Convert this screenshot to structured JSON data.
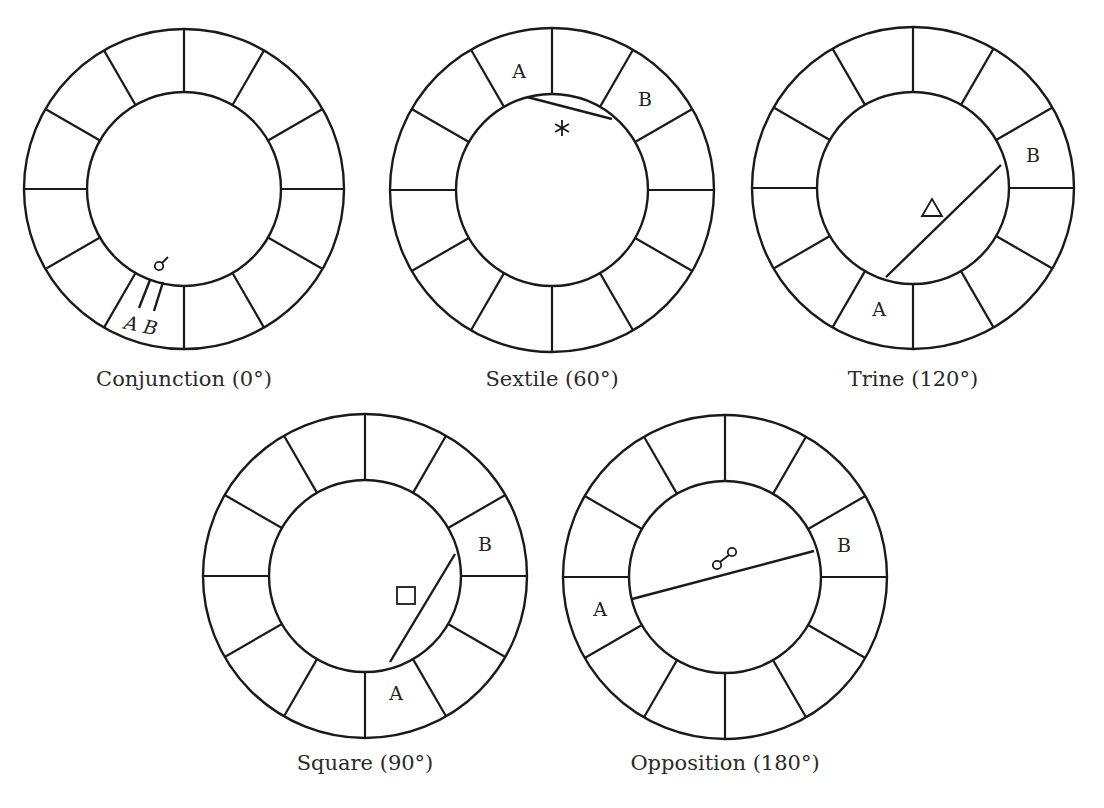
{
  "figure": {
    "background": "#ffffff",
    "line_color": "#1a1a1a",
    "spoke_count": 12,
    "spoke_angle_step_deg": 30
  },
  "wheels": [
    {
      "id": "conjunction",
      "caption": "Conjunction (0°)",
      "aspect_name": "Conjunction",
      "aspect_angle": "0°",
      "cx": 184,
      "cy": 189,
      "r_outer": 160,
      "r_inner": 97,
      "caption_x": 184,
      "caption_y": 386,
      "symbol": "conjunction-glyph",
      "glyph": {
        "type": "conjunction",
        "x": 159,
        "y": 266
      },
      "planets": [
        {
          "label": "A",
          "x": 130,
          "y": 330,
          "italic": true,
          "rotate": 12
        },
        {
          "label": "B",
          "x": 149,
          "y": 334,
          "italic": true,
          "rotate": 12
        }
      ],
      "ticks": [
        {
          "x1": 150,
          "y1": 280,
          "x2": 139,
          "y2": 308
        },
        {
          "x1": 163,
          "y1": 282,
          "x2": 154,
          "y2": 311
        }
      ],
      "chord": null
    },
    {
      "id": "sextile",
      "caption": "Sextile (60°)",
      "aspect_name": "Sextile",
      "aspect_angle": "60°",
      "cx": 552,
      "cy": 190,
      "r_outer": 162,
      "r_inner": 96,
      "caption_x": 552,
      "caption_y": 386,
      "symbol": "sextile-glyph",
      "glyph": {
        "type": "sextile",
        "x": 562,
        "y": 128
      },
      "planets": [
        {
          "label": "A",
          "x": 519,
          "y": 78,
          "italic": false,
          "rotate": 0
        },
        {
          "label": "B",
          "x": 645,
          "y": 106,
          "italic": false,
          "rotate": 0
        }
      ],
      "ticks": [],
      "chord": {
        "x1": 527,
        "y1": 97,
        "x2": 612,
        "y2": 119
      }
    },
    {
      "id": "trine",
      "caption": "Trine (120°)",
      "aspect_name": "Trine",
      "aspect_angle": "120°",
      "cx": 913,
      "cy": 188,
      "r_outer": 161,
      "r_inner": 96,
      "caption_x": 913,
      "caption_y": 386,
      "symbol": "trine-glyph",
      "glyph": {
        "type": "trine",
        "x": 932,
        "y": 208
      },
      "planets": [
        {
          "label": "A",
          "x": 879,
          "y": 316,
          "italic": false,
          "rotate": 0
        },
        {
          "label": "B",
          "x": 1033,
          "y": 162,
          "italic": false,
          "rotate": 0
        }
      ],
      "ticks": [],
      "chord": {
        "x1": 1001,
        "y1": 165,
        "x2": 886,
        "y2": 277
      }
    },
    {
      "id": "square",
      "caption": "Square (90°)",
      "aspect_name": "Square",
      "aspect_angle": "90°",
      "cx": 365,
      "cy": 576,
      "r_outer": 162,
      "r_inner": 96,
      "caption_x": 365,
      "caption_y": 770,
      "symbol": "square-glyph",
      "glyph": {
        "type": "square",
        "x": 406,
        "y": 596
      },
      "planets": [
        {
          "label": "A",
          "x": 396,
          "y": 700,
          "italic": false,
          "rotate": 0
        },
        {
          "label": "B",
          "x": 485,
          "y": 551,
          "italic": false,
          "rotate": 0
        }
      ],
      "ticks": [],
      "chord": {
        "x1": 455,
        "y1": 554,
        "x2": 390,
        "y2": 662
      }
    },
    {
      "id": "opposition",
      "caption": "Opposition (180°)",
      "aspect_name": "Opposition",
      "aspect_angle": "180°",
      "cx": 725,
      "cy": 577,
      "r_outer": 162,
      "r_inner": 96,
      "caption_x": 725,
      "caption_y": 770,
      "symbol": "opposition-glyph",
      "glyph": {
        "type": "opposition",
        "x": 724,
        "y": 559
      },
      "planets": [
        {
          "label": "A",
          "x": 600,
          "y": 616,
          "italic": false,
          "rotate": 0
        },
        {
          "label": "B",
          "x": 844,
          "y": 552,
          "italic": false,
          "rotate": 0
        }
      ],
      "ticks": [],
      "chord": {
        "x1": 632,
        "y1": 599,
        "x2": 814,
        "y2": 551
      }
    }
  ]
}
